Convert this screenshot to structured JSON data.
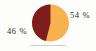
{
  "figure": {
    "background_color": "#fdfdfb",
    "label_color": "#2b2b2b",
    "rule_color": "#c9c6c0"
  },
  "labels": {
    "left": "46 %",
    "right": "54 %"
  },
  "chart_data": {
    "type": "pie",
    "title": "",
    "subtitle": "",
    "xlabel": "",
    "ylabel": "",
    "grid": false,
    "legend": "none",
    "start_angle_deg": 0,
    "direction": "clockwise",
    "categories": [
      "54 %",
      "46 %"
    ],
    "values": [
      54,
      46
    ],
    "value_unit": "percent",
    "data_labels": [
      "54 %",
      "46 %"
    ],
    "data_label_positions": [
      "outside-right",
      "outside-left"
    ],
    "colors": [
      "#f7b24e",
      "#7d1d1d"
    ],
    "slices": [
      {
        "label": "54 %",
        "value": 54,
        "color": "#f7b24e",
        "label_position": "outside-right"
      },
      {
        "label": "46 %",
        "value": 46,
        "color": "#7d1d1d",
        "label_position": "outside-left"
      }
    ]
  }
}
